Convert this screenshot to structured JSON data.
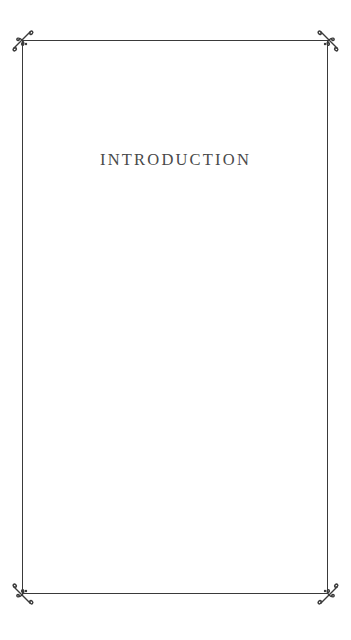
{
  "page": {
    "chapter_title": "INTRODUCTION",
    "colors": {
      "background": "#ffffff",
      "frame": "#3a3a3a",
      "title": "#4a4a4a"
    },
    "ornaments": [
      "flourish-top-left",
      "flourish-top-right",
      "flourish-bottom-left",
      "flourish-bottom-right"
    ]
  }
}
